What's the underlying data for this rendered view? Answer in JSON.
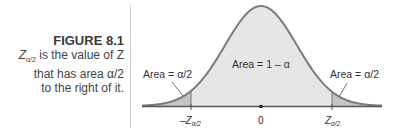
{
  "figure": {
    "label": "FIGURE 8.1",
    "caption_line1_symbol": "Z",
    "caption_line1_sub": "α/2",
    "caption_line1_rest": " is the value of Z",
    "caption_line2": "that has area α/2",
    "caption_line3": "to the right of it."
  },
  "diagram": {
    "center_area_label": "Area = 1 – α",
    "left_area_label": "Area = α/2",
    "right_area_label": "Area = α/2",
    "axis_ticks": [
      {
        "symbol": "–Z",
        "sub": "α/2"
      },
      {
        "symbol": "0",
        "sub": ""
      },
      {
        "symbol": "Z",
        "sub": "α/2"
      }
    ],
    "colors": {
      "curve": "#7a7a7a",
      "body_fill": "#e6e6e6",
      "tail_fill": "#c4c4c4",
      "axis": "#555555"
    }
  }
}
